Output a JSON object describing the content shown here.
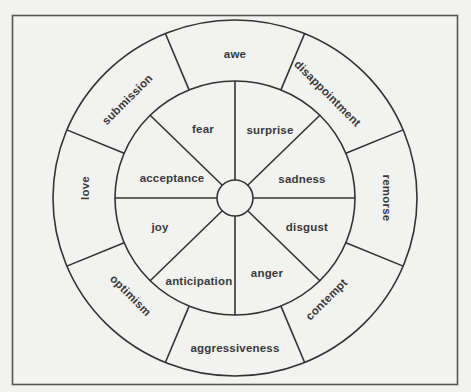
{
  "diagram": {
    "title": "",
    "colors": {
      "background": "#f2f2f0",
      "line": "#333333",
      "text": "#3a3a3a"
    },
    "inner_ring": [
      {
        "label": "surprise",
        "x": 270,
        "y": 131,
        "rot": 0
      },
      {
        "label": "sadness",
        "x": 302,
        "y": 180,
        "rot": 0
      },
      {
        "label": "disgust",
        "x": 307,
        "y": 228,
        "rot": 0
      },
      {
        "label": "anger",
        "x": 267,
        "y": 274,
        "rot": 0
      },
      {
        "label": "anticipation",
        "x": 199,
        "y": 282,
        "rot": 0
      },
      {
        "label": "joy",
        "x": 160,
        "y": 228,
        "rot": 0
      },
      {
        "label": "acceptance",
        "x": 172,
        "y": 179,
        "rot": 0
      },
      {
        "label": "fear",
        "x": 203,
        "y": 130,
        "rot": 0
      }
    ],
    "outer_ring": [
      {
        "label": "awe",
        "x": 235,
        "y": 55,
        "rot": 0
      },
      {
        "label": "disappointment",
        "x": 327,
        "y": 94,
        "rot": 45
      },
      {
        "label": "remorse",
        "x": 386,
        "y": 198,
        "rot": 90
      },
      {
        "label": "contempt",
        "x": 327,
        "y": 300,
        "rot": -45
      },
      {
        "label": "aggressiveness",
        "x": 235,
        "y": 349,
        "rot": 0
      },
      {
        "label": "optimism",
        "x": 130,
        "y": 296,
        "rot": 45
      },
      {
        "label": "love",
        "x": 86,
        "y": 188,
        "rot": -90
      },
      {
        "label": "submission",
        "x": 128,
        "y": 100,
        "rot": -45
      }
    ]
  }
}
